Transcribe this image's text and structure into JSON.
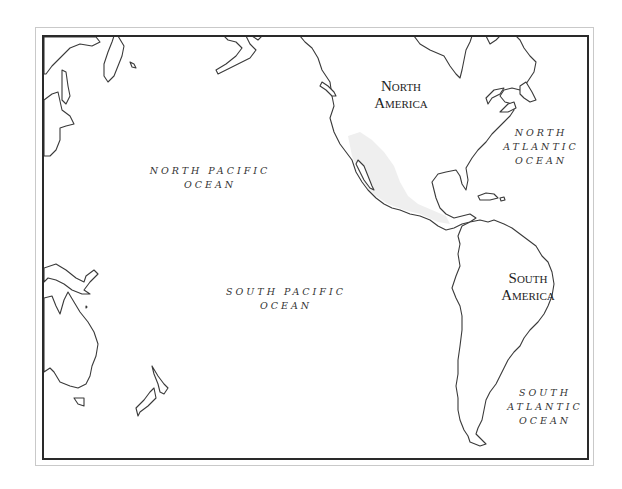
{
  "map": {
    "title": "",
    "continents": [
      {
        "id": "north-america",
        "line1": "North",
        "line2": "America"
      },
      {
        "id": "south-america",
        "line1": "South",
        "line2": "America"
      }
    ],
    "oceans": [
      {
        "id": "north-pacific",
        "lines": [
          "NORTH PACIFIC",
          "OCEAN"
        ]
      },
      {
        "id": "south-pacific",
        "lines": [
          "SOUTH PACIFIC",
          "OCEAN"
        ]
      },
      {
        "id": "north-atlantic",
        "lines": [
          "NORTH",
          "ATLANTIC",
          "OCEAN"
        ]
      },
      {
        "id": "south-atlantic",
        "lines": [
          "SOUTH",
          "ATLANTIC",
          "OCEAN"
        ]
      }
    ],
    "colors": {
      "coastline": "#3a3a3a",
      "frame": "#2a2a2a",
      "outer_frame": "#c9c9c9",
      "land_shade": "#efefef"
    }
  }
}
